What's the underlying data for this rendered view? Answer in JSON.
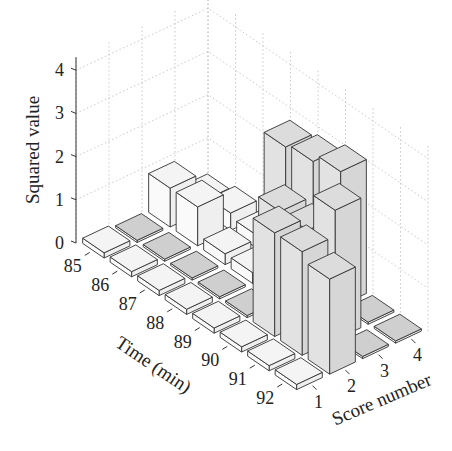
{
  "chart_data": {
    "type": "bar3d",
    "title": "",
    "xlabel": "Time (min)",
    "ylabel": "Score number",
    "zlabel": "Squared value",
    "x_ticks": [
      "85",
      "86",
      "87",
      "88",
      "89",
      "90",
      "91",
      "92"
    ],
    "y_ticks": [
      "1",
      "2",
      "3",
      "4"
    ],
    "z_ticks": [
      "0",
      "1",
      "2",
      "3",
      "4"
    ],
    "zlim": [
      0,
      4.2
    ],
    "grid": true,
    "categories_time": [
      85,
      86,
      87,
      88,
      89,
      90,
      91,
      92
    ],
    "series": [
      {
        "name": "Score 1",
        "values": [
          0.12,
          0.12,
          0.12,
          0.12,
          0.12,
          0.12,
          0.12,
          0.12
        ]
      },
      {
        "name": "Score 2",
        "values": [
          0.05,
          0.05,
          0.05,
          0.05,
          0.05,
          2.4,
          2.4,
          2.2
        ]
      },
      {
        "name": "Score 3",
        "values": [
          0.9,
          0.9,
          0.25,
          0.25,
          2.1,
          2.1,
          3.0,
          0.05
        ]
      },
      {
        "name": "Score 4",
        "values": [
          0.25,
          0.4,
          0.3,
          2.8,
          2.9,
          3.1,
          0.05,
          0.05
        ]
      }
    ]
  },
  "axes": {
    "zlabel": "Squared value",
    "xlabel": "Time (min)",
    "ylabel": "Score number"
  }
}
